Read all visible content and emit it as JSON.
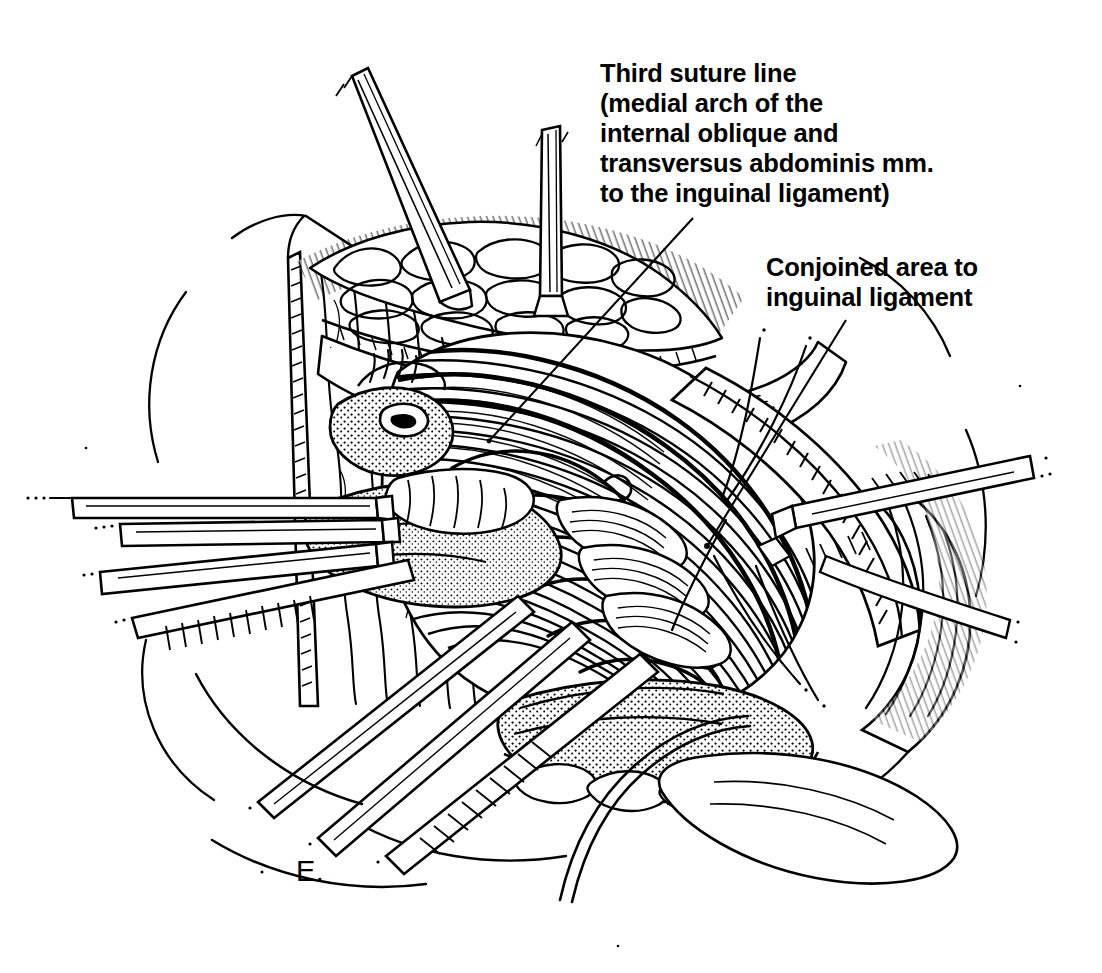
{
  "figure": {
    "letter": "E.",
    "background_color": "#ffffff",
    "ink_color": "#000000",
    "width": 1102,
    "height": 973
  },
  "labels": [
    {
      "id": "third-suture-line",
      "lines": [
        "Third suture line",
        "(medial arch of the",
        "internal oblique and",
        "transversus abdominis mm.",
        "to the inguinal ligament)"
      ],
      "text": "Third suture line\n(medial arch of the\ninternal oblique and\ntransversus abdominis mm.\nto the inguinal ligament)"
    },
    {
      "id": "conjoined-area",
      "lines": [
        "Conjoined area to",
        "inguinal ligament"
      ],
      "text": "Conjoined area to\ninguinal ligament"
    }
  ],
  "leaders": [
    {
      "id": "leader-third-suture",
      "from_x": 693,
      "from_y": 218,
      "to_x": 489,
      "to_y": 441
    },
    {
      "id": "leader-conjoined",
      "from_x": 846,
      "from_y": 320,
      "to_x": 707,
      "to_y": 546
    }
  ],
  "illustration": {
    "title": "Inguinal hernia repair - third suture line",
    "style": "pen-and-ink line drawing",
    "elements": [
      "skin-and-fat-flap-upper-left",
      "retractor-blade-upper",
      "retractor-blade-left-upper",
      "retractor-blade-left-lower",
      "retractor-blade-lower-left",
      "retractor-blade-right",
      "spermatic-cord-stippled",
      "internal-oblique-muscle-hatched",
      "inguinal-ligament",
      "suture-stitch-arcs",
      "suture-thread-tails"
    ]
  }
}
